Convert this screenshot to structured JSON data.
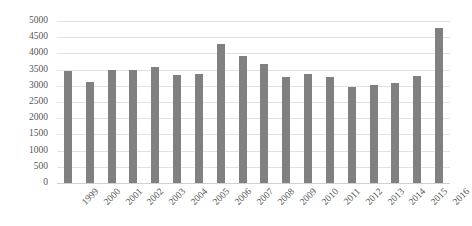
{
  "chart_data": {
    "type": "bar",
    "title": "",
    "subtitle": "",
    "xlabel": "",
    "ylabel": "",
    "categories": [
      "1999",
      "2000",
      "2001",
      "2002",
      "2003",
      "2004",
      "2005",
      "2006",
      "2007",
      "2008",
      "2009",
      "2010",
      "2011",
      "2012",
      "2013",
      "2014",
      "2015",
      "2016"
    ],
    "values": [
      3450,
      3120,
      3480,
      3490,
      3580,
      3320,
      3360,
      4280,
      3930,
      3670,
      3280,
      3370,
      3270,
      2970,
      3010,
      3080,
      3290,
      4780
    ],
    "series": [
      {
        "name": "",
        "values": [
          3450,
          3120,
          3480,
          3490,
          3580,
          3320,
          3360,
          4280,
          3930,
          3670,
          3280,
          3370,
          3270,
          2970,
          3010,
          3080,
          3290,
          4780
        ]
      }
    ],
    "ylim": [
      0,
      5000
    ],
    "ytick_values": [
      0,
      500,
      1000,
      1500,
      2000,
      2500,
      3000,
      3500,
      4000,
      4500,
      5000
    ],
    "ytick_labels": [
      "0",
      "500",
      "1000",
      "1500",
      "2000",
      "2500",
      "3000",
      "3500",
      "4000",
      "4500",
      "5000"
    ],
    "grid": true,
    "grid_axis": "y",
    "legend": false,
    "legend_position": "none",
    "bar_color": "#808080",
    "grid_color": "#e2e2e2",
    "axis_text_color": "#555555",
    "background_color": "#ffffff",
    "annotations": []
  }
}
